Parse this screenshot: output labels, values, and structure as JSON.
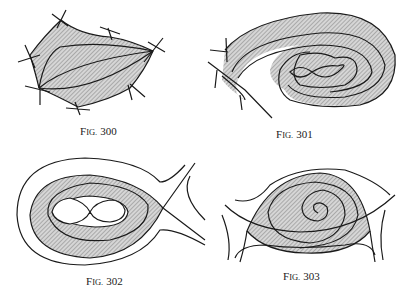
{
  "figures": [
    {
      "id": "fig-300",
      "caption_prefix": "F",
      "caption_smallcaps": "IG.",
      "caption_number": "300",
      "description": "Shaded curvilinear polygon bounded by separatrices between saddle points, with trajectories flowing between two nodes"
    },
    {
      "id": "fig-301",
      "caption_prefix": "F",
      "caption_smallcaps": "IG.",
      "caption_number": "301",
      "description": "Curved shaded band spiraling around a figure-eight separatrix loop, with a saddle at the left"
    },
    {
      "id": "fig-302",
      "caption_prefix": "F",
      "caption_smallcaps": "IG.",
      "caption_number": "302",
      "description": "Teardrop-shaped shaded region around a figure-eight loop, bounded by a saddle separatrix loop"
    },
    {
      "id": "fig-303",
      "caption_prefix": "F",
      "caption_smallcaps": "IG.",
      "caption_number": "303",
      "description": "Lens-shaped shaded region bounded by separatrices of two saddles, containing a spiral focus"
    }
  ],
  "style": {
    "ink": "#1a1a1a",
    "shade": "#bdbdbd",
    "background": "#ffffff"
  }
}
